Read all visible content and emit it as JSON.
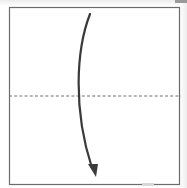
{
  "diagram": {
    "title": "Valley fold in half, top to bottom",
    "paper": {
      "shape": "square",
      "x": 9,
      "y": 7,
      "width": 170,
      "height": 177,
      "fill": "#ffffff",
      "stroke": "#6b6b6b"
    },
    "fold_line": {
      "type": "valley-fold",
      "style": "dashed",
      "y": 96,
      "x1": 9,
      "x2": 181,
      "stroke": "#6e6e6e"
    },
    "arrow": {
      "direction": "down",
      "meaning": "fold top edge down to bottom edge",
      "path": "M 90 14 C 76 50, 73 110, 92 168",
      "stroke": "#3a3a3a",
      "head": "88,164 98,164 96,177"
    }
  }
}
